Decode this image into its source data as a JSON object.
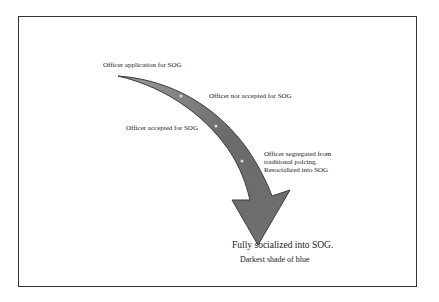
{
  "diagram": {
    "labels": {
      "application": "Officer application for SOG",
      "not_accepted": "Officer not accepted for SOG",
      "accepted": "Officer accepted for SOG",
      "segregated_1": "Officer segregated from",
      "segregated_2": "traditional polcing.",
      "segregated_3": "Resocialized into SOG",
      "final_1": "Fully socialized into SOG.",
      "final_2": "Darkest shade of blue"
    },
    "colors": {
      "arrow_fill": "#6e6e6e",
      "arrow_edge": "#3a3a3a",
      "border": "#333333"
    }
  }
}
